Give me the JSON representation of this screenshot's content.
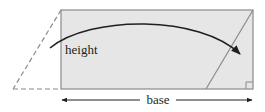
{
  "diagram": {
    "labels": {
      "height": "height",
      "base": "base"
    },
    "colors": {
      "rect_fill": "#e6e6e7",
      "rect_stroke": "#8a8a8c",
      "dashed_stroke": "#8a8a8c",
      "arrow": "#231f20",
      "text": "#231f20"
    },
    "elements": [
      {
        "name": "rectangle",
        "description": "shaded rectangle"
      },
      {
        "name": "dashed-triangle",
        "description": "dashed outline of triangle cut from left side"
      },
      {
        "name": "slant-line",
        "description": "slanted edge inside rectangle at right"
      },
      {
        "name": "curved-arrow",
        "description": "arrow showing triangle moved from left to right"
      },
      {
        "name": "right-angle-marker",
        "description": "small square at bottom-right corner"
      },
      {
        "name": "base-arrow",
        "description": "double-headed arrow indicating base"
      }
    ]
  }
}
